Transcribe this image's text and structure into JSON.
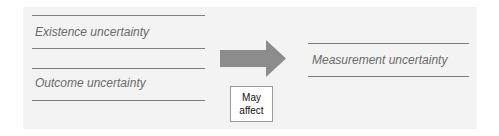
{
  "diagram": {
    "left_items": [
      {
        "label": "Existence uncertainty"
      },
      {
        "label": "Outcome uncertainty"
      }
    ],
    "connector": {
      "type": "arrow",
      "direction": "right",
      "color": "#8c8c8c"
    },
    "note": {
      "line1": "May",
      "line2": "affect"
    },
    "right_item": {
      "label": "Measurement uncertainty"
    }
  }
}
